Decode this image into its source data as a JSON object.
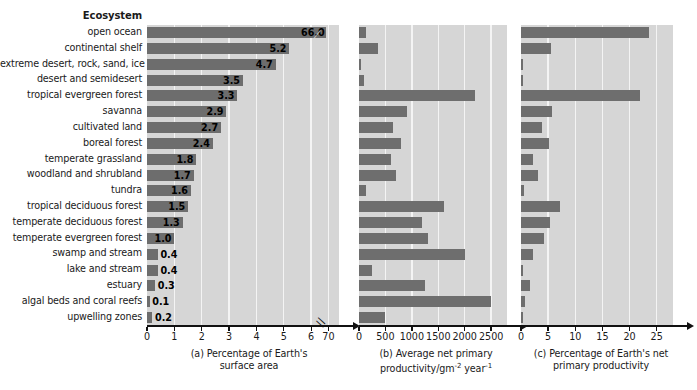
{
  "header": {
    "ecosystem_label": "Ecosystem"
  },
  "chart_data": {
    "type": "bar",
    "orientation": "horizontal",
    "title": "",
    "categories": [
      "open ocean",
      "continental shelf",
      "extreme desert, rock, sand, ice",
      "desert and semidesert",
      "tropical evergreen forest",
      "savanna",
      "cultivated land",
      "boreal forest",
      "temperate grassland",
      "woodland and shrubland",
      "tundra",
      "tropical deciduous forest",
      "temperate deciduous forest",
      "temperate evergreen forest",
      "swamp and stream",
      "lake and stream",
      "estuary",
      "algal beds and coral reefs",
      "upwelling zones"
    ],
    "panels": [
      {
        "id": "a",
        "caption_lines": [
          "(a) Percentage of Earth's",
          "surface area"
        ],
        "xlabel": "Percentage of Earth's surface area",
        "tick_labels": [
          "0",
          "1",
          "2",
          "3",
          "4",
          "5",
          "6",
          "70"
        ],
        "tick_values": [
          0,
          1,
          2,
          3,
          4,
          5,
          6,
          7
        ],
        "axis_break_after": "6",
        "grid": true,
        "values": [
          66.0,
          5.2,
          4.7,
          3.5,
          3.3,
          2.9,
          2.7,
          2.4,
          1.8,
          1.7,
          1.6,
          1.5,
          1.3,
          1.0,
          0.4,
          0.4,
          0.3,
          0.1,
          0.2
        ],
        "value_labels": [
          "66.0",
          "5.2",
          "4.7",
          "3.5",
          "3.3",
          "2.9",
          "2.7",
          "2.4",
          "1.8",
          "1.7",
          "1.6",
          "1.5",
          "1.3",
          "1.0",
          "0.4",
          "0.4",
          "0.3",
          "0.1",
          "0.2"
        ],
        "show_value_labels": true
      },
      {
        "id": "b",
        "caption_lines": [
          "(b) Average net primary",
          "productivity/gm<sup>-2</sup> year<sup>-1</sup>"
        ],
        "xlabel": "Average net primary productivity/gm-2 year-1",
        "tick_labels": [
          "0",
          "500",
          "1000",
          "1500",
          "2000",
          "2500"
        ],
        "tick_values": [
          0,
          500,
          1000,
          1500,
          2000,
          2500
        ],
        "xlim": [
          0,
          2800
        ],
        "grid": true,
        "values": [
          125,
          360,
          3,
          90,
          2200,
          900,
          650,
          800,
          600,
          700,
          140,
          1600,
          1200,
          1300,
          2000,
          250,
          1250,
          2500,
          500
        ],
        "show_value_labels": false
      },
      {
        "id": "c",
        "caption_lines": [
          "(c) Percentage of Earth's net",
          "primary productivity"
        ],
        "xlabel": "Percentage of Earth's net primary productivity",
        "tick_labels": [
          "0",
          "5",
          "10",
          "15",
          "20",
          "25"
        ],
        "tick_values": [
          0,
          5,
          10,
          15,
          20,
          25
        ],
        "xlim": [
          0,
          28
        ],
        "grid": true,
        "values": [
          23.5,
          5.5,
          0.3,
          0.1,
          22.0,
          5.8,
          3.8,
          5.2,
          2.3,
          3.1,
          0.6,
          7.1,
          5.4,
          4.3,
          2.3,
          0.4,
          1.6,
          0.8,
          0.2
        ],
        "show_value_labels": false
      }
    ]
  },
  "colors": {
    "bar": "#6e6e6e",
    "plot_background": "#d6d6d6",
    "gridline": "#f4f4f4",
    "axis": "#111111",
    "text": "#1a1a1a"
  }
}
